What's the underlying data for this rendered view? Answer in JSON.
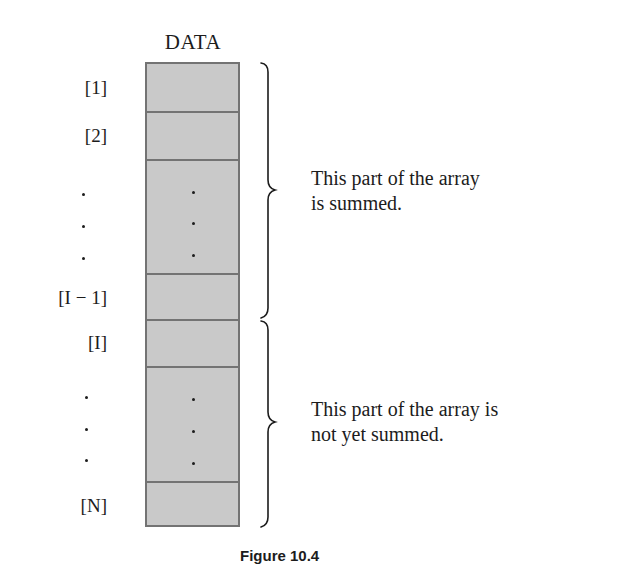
{
  "diagram": {
    "title": "DATA",
    "array": {
      "fill_color": "#c9c9c9",
      "border_color": "#737373",
      "cells": [
        {
          "label": "[1]",
          "content": ""
        },
        {
          "label": "[2]",
          "content": ""
        },
        {
          "label": "·  ·  ·",
          "content": "·  ·  ·"
        },
        {
          "label": "[I − 1]",
          "content": ""
        },
        {
          "label": "[I]",
          "content": ""
        },
        {
          "label": "·  ·  ·",
          "content": "·  ·  ·"
        },
        {
          "label": "[N]",
          "content": ""
        }
      ]
    },
    "index_labels": {
      "first": "[1]",
      "second": "[2]",
      "i_minus_1": "[I − 1]",
      "i": "[I]",
      "n": "[N]"
    },
    "annotations": {
      "summed": {
        "line1": "This part of the array",
        "line2": "is summed."
      },
      "not_summed": {
        "line1": "This part of the array is",
        "line2": "not yet summed."
      }
    },
    "caption": "Figure 10.4"
  }
}
